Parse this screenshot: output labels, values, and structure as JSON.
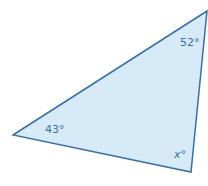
{
  "diagram": {
    "type": "triangle",
    "fill": "#d6eaf8",
    "stroke": "#3b6fa3",
    "vertices": {
      "top_right": [
        207,
        11
      ],
      "left": [
        13,
        135
      ],
      "bottom": [
        191,
        172
      ]
    },
    "angles": {
      "top": "52°",
      "left": "43°",
      "bottom": "x°"
    }
  }
}
